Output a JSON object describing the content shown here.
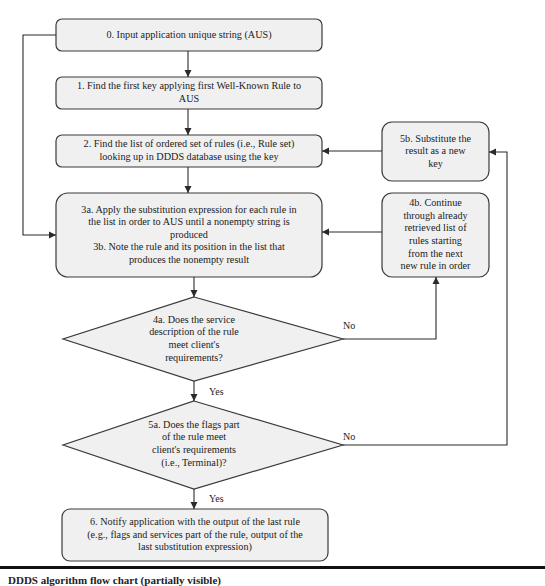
{
  "diagram": {
    "type": "flowchart",
    "colors": {
      "box_fill": "#f0f0f0",
      "stroke": "#3a3a3a",
      "background": "#ffffff"
    },
    "nodes": [
      {
        "id": "step0",
        "shape": "rounded-rect",
        "text": "0. Input application unique string (AUS)"
      },
      {
        "id": "step1",
        "shape": "rounded-rect",
        "text": "1.  Find the first key applying first Well-Known Rule to\nAUS"
      },
      {
        "id": "step2",
        "shape": "rounded-rect",
        "text": "2. Find the list of ordered set of rules (i.e., Rule set)\nlooking up in DDDS database using the key"
      },
      {
        "id": "step3",
        "shape": "rounded-rect",
        "text": "3a.  Apply the substitution expression for each rule in\nthe list in order to AUS until a nonempty string is\nproduced\n3b. Note the rule and its position in the list that\nproduces the nonempty result"
      },
      {
        "id": "step4a",
        "shape": "diamond",
        "text": "4a. Does the service\ndescription of the rule\nmeet client's\nrequirements?"
      },
      {
        "id": "step4b",
        "shape": "rounded-rect",
        "text": "4b. Continue\nthrough already\nretrieved list of\nrules starting\nfrom the next\nnew rule in order"
      },
      {
        "id": "step5a",
        "shape": "diamond",
        "text": "5a. Does the flags part\nof the rule meet\nclient's requirements\n(i.e., Terminal)?"
      },
      {
        "id": "step5b",
        "shape": "rounded-rect",
        "text": "5b. Substitute the\nresult as a new\nkey"
      },
      {
        "id": "step6",
        "shape": "rounded-rect",
        "text": "6. Notify application with the output of the last rule\n(e.g., flags and services part of the rule, output of the\nlast substitution expression)"
      }
    ],
    "edges": [
      {
        "from": "step0",
        "to": "step1",
        "label": ""
      },
      {
        "from": "step1",
        "to": "step2",
        "label": ""
      },
      {
        "from": "step2",
        "to": "step3",
        "label": ""
      },
      {
        "from": "step0",
        "to": "step3",
        "label": ""
      },
      {
        "from": "step3",
        "to": "step4a",
        "label": ""
      },
      {
        "from": "step4a",
        "to": "step4b",
        "label": "No"
      },
      {
        "from": "step4b",
        "to": "step3",
        "label": ""
      },
      {
        "from": "step4a",
        "to": "step5a",
        "label": "Yes"
      },
      {
        "from": "step5a",
        "to": "step5b",
        "label": "No"
      },
      {
        "from": "step5b",
        "to": "step2",
        "label": ""
      },
      {
        "from": "step5a",
        "to": "step6",
        "label": "Yes"
      }
    ],
    "edge_labels": {
      "no_4a": "No",
      "yes_4a": "Yes",
      "no_5a": "No",
      "yes_5a": "Yes"
    },
    "caption": "DDDS algorithm flow chart (partially visible)"
  }
}
